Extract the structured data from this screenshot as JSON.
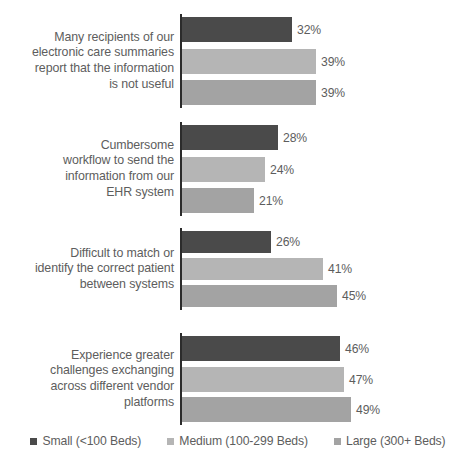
{
  "chart_data": {
    "type": "bar",
    "orientation": "horizontal",
    "title": "",
    "subtitle": "",
    "xlabel": "",
    "ylabel": "",
    "grid": false,
    "xlim": [
      0,
      50
    ],
    "legend_position": "bottom",
    "value_suffix": "%",
    "categories": [
      "Many recipients of our electronic care summaries report that the information is not useful",
      "Cumbersome workflow to send the information from our EHR system",
      "Difficult to match or identify the correct patient between systems",
      "Experience greater challenges exchanging across different vendor platforms"
    ],
    "category_lines": [
      [
        "Many recipients of our",
        "electronic care summaries",
        "report that the information",
        "is not useful"
      ],
      [
        "Cumbersome",
        "workflow to send the",
        "information from our",
        "EHR system"
      ],
      [
        "Difficult to match or",
        "identify the correct patient",
        "between systems"
      ],
      [
        "Experience greater",
        "challenges exchanging",
        "across different vendor",
        "platforms"
      ]
    ],
    "series": [
      {
        "name": "Small (<100 Beds)",
        "color": "#4a4a4a",
        "values": [
          32,
          28,
          26,
          46
        ],
        "labels": [
          "32%",
          "28%",
          "26%",
          "46%"
        ]
      },
      {
        "name": "Medium (100-299 Beds)",
        "color": "#b5b5b5",
        "values": [
          39,
          24,
          41,
          47
        ],
        "labels": [
          "39%",
          "24%",
          "41%",
          "47%"
        ]
      },
      {
        "name": "Large (300+ Beds)",
        "color": "#a3a3a3",
        "values": [
          39,
          21,
          45,
          49
        ],
        "labels": [
          "39%",
          "21%",
          "45%",
          "49%"
        ]
      }
    ]
  },
  "legend": {
    "items": [
      {
        "label": "Small (<100 Beds)",
        "color": "#4a4a4a"
      },
      {
        "label": "Medium (100-299 Beds)",
        "color": "#b5b5b5"
      },
      {
        "label": "Large (300+ Beds)",
        "color": "#a3a3a3"
      }
    ]
  },
  "layout": {
    "axis_color": "#2b2b2b",
    "text_color": "#5d5d5d",
    "background": "#ffffff",
    "px_per_percent": 3.44,
    "groups": [
      {
        "top": 14,
        "height": 94
      },
      {
        "top": 122,
        "height": 94
      },
      {
        "top": 228,
        "height": 82
      },
      {
        "top": 333,
        "height": 92
      }
    ]
  }
}
